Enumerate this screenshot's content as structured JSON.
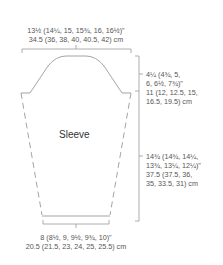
{
  "diagram": {
    "piece_label": "Sleeve",
    "colors": {
      "line": "#9a9a9a",
      "text": "#555555",
      "label": "#333333"
    }
  },
  "measurements": {
    "top_width": {
      "inches": "13½ (14¼, 15, 15¾, 16, 16½)\"",
      "cm": "34.5 (36, 38, 40, 40.5, 42) cm"
    },
    "cap_height": {
      "line1": "4¼ (4¾, 5,",
      "line2": "6, 6½, 7¾)\"",
      "line3": "11 (12, 12.5, 15,",
      "line4": "16.5, 19.5) cm"
    },
    "sleeve_length": {
      "line1": "14¾ (14¾, 14¼,",
      "line2": "13¾, 13¼, 12¼)\"",
      "line3": "37.5 (37.5, 36,",
      "line4": "35, 33.5, 31) cm"
    },
    "cuff_width": {
      "inches": "8 (8½, 9, 9½, 9¾, 10)\"",
      "cm": "20.5 (21.5, 23, 24, 25, 25.5) cm"
    }
  }
}
